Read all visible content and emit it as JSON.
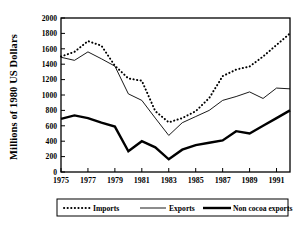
{
  "chart_data": {
    "type": "line",
    "title": "",
    "xlabel": "",
    "ylabel": "Millions of 1980 US Dollars",
    "xlim": [
      1975,
      1992
    ],
    "ylim": [
      0,
      2000
    ],
    "grid": false,
    "legend_position": "bottom",
    "x": [
      1975,
      1976,
      1977,
      1978,
      1979,
      1980,
      1981,
      1982,
      1983,
      1984,
      1985,
      1986,
      1987,
      1988,
      1989,
      1990,
      1991,
      1992
    ],
    "xtick_labels": [
      "1975",
      "1977",
      "1979",
      "1981",
      "1983",
      "1985",
      "1987",
      "1989",
      "1991"
    ],
    "xticks": [
      1975,
      1977,
      1979,
      1981,
      1983,
      1985,
      1987,
      1989,
      1991
    ],
    "ytick_labels": [
      "0",
      "200",
      "400",
      "600",
      "800",
      "1000",
      "1200",
      "1400",
      "1600",
      "1800",
      "2000"
    ],
    "yticks": [
      0,
      200,
      400,
      600,
      800,
      1000,
      1200,
      1400,
      1600,
      1800,
      2000
    ],
    "series": [
      {
        "name": "Imports",
        "style": "dotted",
        "color": "#000000",
        "width": 2.0,
        "values": [
          1500,
          1560,
          1700,
          1640,
          1380,
          1215,
          1185,
          790,
          645,
          700,
          790,
          960,
          1245,
          1330,
          1370,
          1500,
          1650,
          1800
        ]
      },
      {
        "name": "Exports",
        "style": "solid-thin",
        "color": "#000000",
        "width": 0.9,
        "values": [
          1490,
          1450,
          1560,
          1470,
          1375,
          1015,
          930,
          700,
          475,
          640,
          720,
          800,
          930,
          980,
          1040,
          955,
          1090,
          1080
        ]
      },
      {
        "name": "Non cocoa exports",
        "style": "solid-thick",
        "color": "#000000",
        "width": 2.4,
        "values": [
          690,
          735,
          700,
          640,
          590,
          270,
          400,
          320,
          165,
          290,
          350,
          380,
          410,
          530,
          500,
          600,
          700,
          800
        ]
      }
    ]
  },
  "legend": {
    "items": [
      {
        "label": "Imports",
        "marker": "dotted"
      },
      {
        "label": "Exports",
        "marker": "solid-thin"
      },
      {
        "label": "Non cocoa exports",
        "marker": "solid-thick"
      }
    ]
  }
}
